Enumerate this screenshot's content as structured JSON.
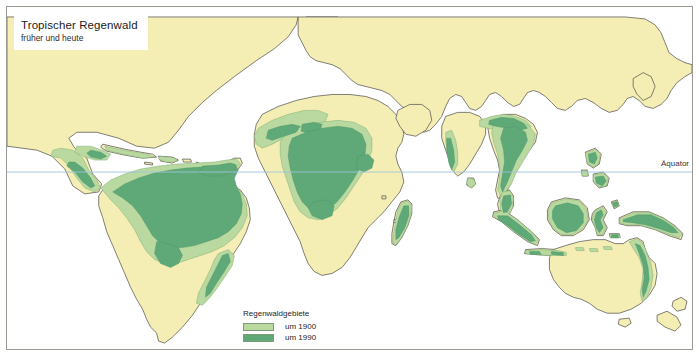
{
  "title": {
    "main": "Tropischer Regenwald",
    "subtitle": "früher und heute"
  },
  "annotations": {
    "equator": "Äquator"
  },
  "legend": {
    "heading": "Regenwaldgebiete",
    "items": [
      {
        "label": "um 1900",
        "color": "#b9d9a0"
      },
      {
        "label": "um 1990",
        "color": "#5fa877"
      }
    ]
  },
  "colors": {
    "ocean": "#ffffff",
    "land": "#f5eeb4",
    "rainforest_1900": "#b9d9a0",
    "rainforest_1990": "#5fa877",
    "coastline": "#4a4a46",
    "equator_line": "#9fc4dd",
    "frame": "#9a9a93"
  },
  "map": {
    "projection": "world-map",
    "theme": "tropical rainforest extent, 1900 vs 1990",
    "regions": [
      "Central America",
      "Amazon Basin",
      "West Africa",
      "Congo Basin",
      "Madagascar",
      "India Western Ghats",
      "Southeast Asia",
      "Indonesia",
      "New Guinea",
      "Northeast Australia"
    ]
  }
}
